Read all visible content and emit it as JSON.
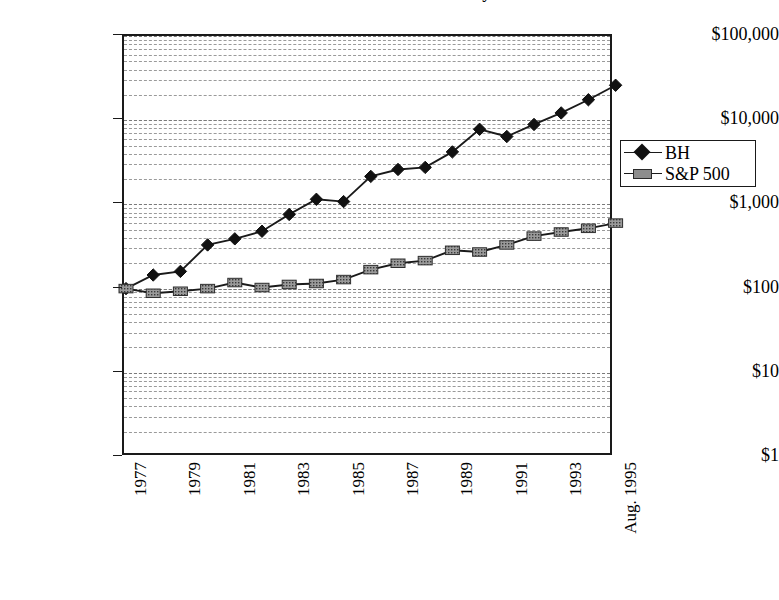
{
  "chart_data": {
    "type": "line",
    "title": "Growth of $100 — Berkshire Hathaway vs. S&P 500",
    "xlabel": "",
    "ylabel": "",
    "scale": "log",
    "ylim": [
      1,
      100000
    ],
    "grid": true,
    "legend_position": "right",
    "y_ticks": [
      {
        "value": 100000,
        "label": "$100,000"
      },
      {
        "value": 10000,
        "label": "$10,000"
      },
      {
        "value": 1000,
        "label": "$1,000"
      },
      {
        "value": 100,
        "label": "$100"
      },
      {
        "value": 10,
        "label": "$10"
      },
      {
        "value": 1,
        "label": "$1"
      }
    ],
    "x": [
      1977,
      1978,
      1979,
      1980,
      1981,
      1982,
      1983,
      1984,
      1985,
      1986,
      1987,
      1988,
      1989,
      1990,
      1991,
      1992,
      1993,
      1994,
      1995
    ],
    "x_tick_labels": [
      "1977",
      "",
      "1979",
      "",
      "1981",
      "",
      "1983",
      "",
      "1985",
      "",
      "1987",
      "",
      "1989",
      "",
      "1991",
      "",
      "1993",
      "",
      "Aug. 1995"
    ],
    "series": [
      {
        "name": "BH",
        "marker": "diamond",
        "color": "#111111",
        "values": [
          100,
          145,
          160,
          330,
          390,
          480,
          760,
          1150,
          1080,
          2150,
          2600,
          2750,
          4200,
          7800,
          6400,
          8900,
          12200,
          17500,
          26000
        ]
      },
      {
        "name": "S&P 500",
        "marker": "square",
        "color": "#8d8d8d",
        "values": [
          100,
          88,
          93,
          100,
          118,
          103,
          112,
          115,
          128,
          168,
          200,
          215,
          285,
          272,
          330,
          420,
          470,
          520,
          600
        ]
      }
    ]
  },
  "legend": {
    "items": [
      {
        "label": "BH"
      },
      {
        "label": "S&P 500"
      }
    ]
  }
}
